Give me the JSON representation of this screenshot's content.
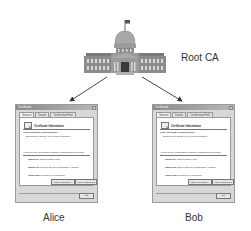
{
  "diagram": {
    "root": {
      "label": "Root CA"
    },
    "nodes": [
      {
        "id": "alice",
        "label": "Alice"
      },
      {
        "id": "bob",
        "label": "Bob"
      }
    ],
    "edges": [
      {
        "from": "root",
        "to": "alice"
      },
      {
        "from": "root",
        "to": "bob"
      }
    ]
  },
  "dialogs": {
    "alice": {
      "title": "Certificate",
      "tabs": [
        "General",
        "Details",
        "Certification Path"
      ],
      "heading": "Certificate Information",
      "purpose_title": "This certificate is intended for:",
      "purpose_text": "Ensures the identity of a remote computer",
      "ref_note": "* Refer to the certification authority's statement for details.",
      "issued_to_label": "Issued to:",
      "issued_to_value": "www.example.com",
      "issued_by_label": "Issued by:",
      "issued_by_value": "Secure Server Certification Authority",
      "valid_label": "Valid from",
      "valid_value": "1/01/2009 to 1/01/2010",
      "install_button": "Install Certificate...",
      "issuer_button": "Issuer Statement",
      "ok_button": "OK"
    },
    "bob": {
      "title": "Certificate",
      "tabs": [
        "General",
        "Details",
        "Certification Path"
      ],
      "heading": "Certificate Information",
      "purpose_title": "This certificate is intended for:",
      "purpose_text": "Ensures the identity of a remote computer",
      "ref_note": "* Refer to the certification authority's statement for details.",
      "issued_to_label": "Issued to:",
      "issued_to_value": "www.example.com",
      "issued_by_label": "Issued by:",
      "issued_by_value": "Secure Server Certification Authority",
      "valid_label": "Valid from",
      "valid_value": "1/01/2009 to 1/01/2010",
      "install_button": "Install Certificate...",
      "issuer_button": "Issuer Statement",
      "ok_button": "OK"
    }
  },
  "colors": {
    "building": "#8c8c8c",
    "building_dark": "#5a5a5a",
    "arrow": "#333333",
    "text": "#333333"
  }
}
